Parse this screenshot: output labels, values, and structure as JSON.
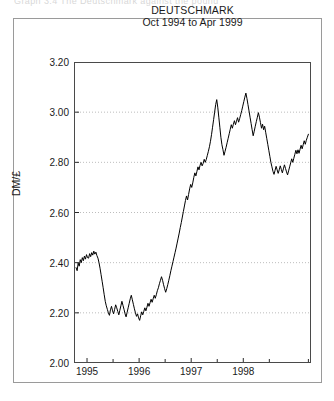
{
  "figure": {
    "top_clipped_text": "Graph 3.4  The Deutschmark against the pound",
    "y_axis_title": "DM/£"
  },
  "chart_data": {
    "type": "line",
    "title": "DEUTSCHMARK",
    "subtitle": "Oct 1994 to Apr 1999",
    "xlabel": "",
    "ylabel": "DM/£",
    "ylim": [
      2.0,
      3.2
    ],
    "ytick_labels": [
      "3.20",
      "3.00",
      "2.80",
      "2.60",
      "2.40",
      "2.20",
      "2.00"
    ],
    "ytick_values": [
      3.2,
      3.0,
      2.8,
      2.6,
      2.4,
      2.2,
      2.0
    ],
    "xtick_labels": [
      "1995",
      "1996",
      "1997",
      "1998"
    ],
    "xtick_values": [
      1995.0,
      1996.0,
      1997.0,
      1998.0
    ],
    "xlim": [
      1994.75,
      1999.3
    ],
    "minor_xticks": [
      1994.75,
      1995.5,
      1996.5,
      1997.5,
      1998.5,
      1999.25
    ],
    "grid": "horizontal-dotted",
    "legend": "none",
    "line_color": "#000000",
    "series": [
      {
        "name": "DM per £",
        "x": [
          1994.79,
          1994.81,
          1994.83,
          1994.85,
          1994.87,
          1994.89,
          1994.91,
          1994.93,
          1994.95,
          1994.97,
          1994.99,
          1995.01,
          1995.03,
          1995.05,
          1995.07,
          1995.09,
          1995.11,
          1995.13,
          1995.15,
          1995.17,
          1995.19,
          1995.21,
          1995.23,
          1995.25,
          1995.27,
          1995.29,
          1995.31,
          1995.33,
          1995.35,
          1995.37,
          1995.39,
          1995.41,
          1995.43,
          1995.45,
          1995.47,
          1995.49,
          1995.51,
          1995.53,
          1995.55,
          1995.57,
          1995.59,
          1995.61,
          1995.63,
          1995.65,
          1995.67,
          1995.69,
          1995.71,
          1995.73,
          1995.75,
          1995.77,
          1995.79,
          1995.81,
          1995.83,
          1995.85,
          1995.87,
          1995.89,
          1995.91,
          1995.93,
          1995.95,
          1995.97,
          1995.99,
          1996.01,
          1996.03,
          1996.05,
          1996.07,
          1996.09,
          1996.11,
          1996.13,
          1996.15,
          1996.17,
          1996.19,
          1996.21,
          1996.23,
          1996.25,
          1996.27,
          1996.29,
          1996.31,
          1996.33,
          1996.35,
          1996.37,
          1996.39,
          1996.41,
          1996.43,
          1996.45,
          1996.47,
          1996.49,
          1996.51,
          1996.53,
          1996.55,
          1996.57,
          1996.59,
          1996.61,
          1996.63,
          1996.65,
          1996.67,
          1996.69,
          1996.71,
          1996.73,
          1996.75,
          1996.77,
          1996.79,
          1996.81,
          1996.83,
          1996.85,
          1996.87,
          1996.89,
          1996.91,
          1996.93,
          1996.95,
          1996.97,
          1996.99,
          1997.01,
          1997.03,
          1997.05,
          1997.07,
          1997.09,
          1997.11,
          1997.13,
          1997.15,
          1997.17,
          1997.19,
          1997.21,
          1997.23,
          1997.25,
          1997.27,
          1997.29,
          1997.31,
          1997.33,
          1997.35,
          1997.37,
          1997.39,
          1997.41,
          1997.43,
          1997.45,
          1997.47,
          1997.49,
          1997.51,
          1997.53,
          1997.55,
          1997.57,
          1997.59,
          1997.61,
          1997.63,
          1997.65,
          1997.67,
          1997.69,
          1997.71,
          1997.73,
          1997.75,
          1997.77,
          1997.79,
          1997.81,
          1997.83,
          1997.85,
          1997.87,
          1997.89,
          1997.91,
          1997.93,
          1997.95,
          1997.97,
          1997.99,
          1998.01,
          1998.03,
          1998.05,
          1998.07,
          1998.09,
          1998.11,
          1998.13,
          1998.15,
          1998.17,
          1998.19,
          1998.21,
          1998.23,
          1998.25,
          1998.27,
          1998.29,
          1998.31,
          1998.33,
          1998.35,
          1998.37,
          1998.39,
          1998.41,
          1998.43,
          1998.45,
          1998.47,
          1998.49,
          1998.51,
          1998.53,
          1998.55,
          1998.57,
          1998.59,
          1998.61,
          1998.63,
          1998.65,
          1998.67,
          1998.69,
          1998.71,
          1998.73,
          1998.75,
          1998.77,
          1998.79,
          1998.81,
          1998.83,
          1998.85,
          1998.87,
          1998.89,
          1998.91,
          1998.93,
          1998.95,
          1998.97,
          1998.99,
          1999.01,
          1999.03,
          1999.05,
          1999.07,
          1999.09,
          1999.11,
          1999.13,
          1999.15,
          1999.17,
          1999.19,
          1999.21,
          1999.23,
          1999.25
        ],
        "y": [
          2.38,
          2.368,
          2.398,
          2.386,
          2.412,
          2.4,
          2.42,
          2.408,
          2.426,
          2.414,
          2.432,
          2.42,
          2.418,
          2.436,
          2.424,
          2.44,
          2.43,
          2.446,
          2.434,
          2.442,
          2.428,
          2.418,
          2.4,
          2.378,
          2.352,
          2.326,
          2.3,
          2.272,
          2.246,
          2.228,
          2.214,
          2.2,
          2.19,
          2.212,
          2.226,
          2.208,
          2.196,
          2.214,
          2.232,
          2.22,
          2.206,
          2.192,
          2.21,
          2.228,
          2.246,
          2.23,
          2.214,
          2.196,
          2.184,
          2.202,
          2.22,
          2.238,
          2.256,
          2.27,
          2.252,
          2.234,
          2.216,
          2.2,
          2.186,
          2.196,
          2.18,
          2.17,
          2.188,
          2.204,
          2.192,
          2.206,
          2.22,
          2.208,
          2.222,
          2.238,
          2.226,
          2.24,
          2.254,
          2.242,
          2.256,
          2.27,
          2.258,
          2.272,
          2.288,
          2.3,
          2.316,
          2.33,
          2.344,
          2.33,
          2.312,
          2.296,
          2.282,
          2.296,
          2.312,
          2.33,
          2.348,
          2.368,
          2.386,
          2.404,
          2.422,
          2.44,
          2.458,
          2.478,
          2.498,
          2.518,
          2.54,
          2.56,
          2.582,
          2.604,
          2.626,
          2.648,
          2.666,
          2.65,
          2.672,
          2.694,
          2.712,
          2.7,
          2.718,
          2.74,
          2.758,
          2.746,
          2.764,
          2.782,
          2.77,
          2.788,
          2.8,
          2.786,
          2.796,
          2.812,
          2.8,
          2.812,
          2.828,
          2.844,
          2.862,
          2.884,
          2.91,
          2.94,
          2.97,
          3.0,
          3.03,
          3.05,
          3.02,
          2.98,
          2.94,
          2.9,
          2.87,
          2.85,
          2.828,
          2.844,
          2.86,
          2.878,
          2.896,
          2.914,
          2.932,
          2.95,
          2.936,
          2.952,
          2.966,
          2.95,
          2.964,
          2.978,
          2.96,
          2.974,
          2.99,
          3.006,
          3.024,
          3.042,
          3.06,
          3.076,
          3.055,
          3.03,
          3.005,
          2.98,
          2.955,
          2.93,
          2.906,
          2.924,
          2.944,
          2.962,
          2.98,
          2.998,
          2.98,
          2.958,
          2.936,
          2.952,
          2.93,
          2.944,
          2.92,
          2.896,
          2.872,
          2.848,
          2.824,
          2.8,
          2.782,
          2.764,
          2.752,
          2.768,
          2.784,
          2.77,
          2.756,
          2.77,
          2.786,
          2.772,
          2.758,
          2.774,
          2.79,
          2.776,
          2.762,
          2.75,
          2.766,
          2.782,
          2.798,
          2.814,
          2.8,
          2.816,
          2.832,
          2.848,
          2.834,
          2.85,
          2.836,
          2.852,
          2.868,
          2.854,
          2.87,
          2.886,
          2.872,
          2.888,
          2.9,
          2.912
        ]
      }
    ]
  }
}
